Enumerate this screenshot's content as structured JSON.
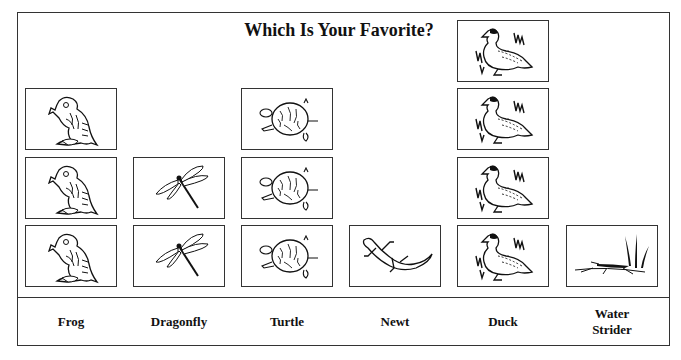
{
  "chart_data": {
    "type": "pictograph",
    "title": "Which Is Your Favorite?",
    "xlabel": "",
    "ylabel": "",
    "categories": [
      "Frog",
      "Dragonfly",
      "Turtle",
      "Newt",
      "Duck",
      "Water\nStrider"
    ],
    "values": [
      3,
      2,
      3,
      1,
      4,
      1
    ],
    "icons": [
      "frog-icon",
      "dragonfly-icon",
      "turtle-icon",
      "newt-icon",
      "duck-icon",
      "water-strider-icon"
    ],
    "unit": "1 picture = 1 vote",
    "grid": false,
    "legend": "none"
  },
  "colors": {
    "stroke": "#333333",
    "ink": "#111111",
    "background": "#ffffff"
  }
}
